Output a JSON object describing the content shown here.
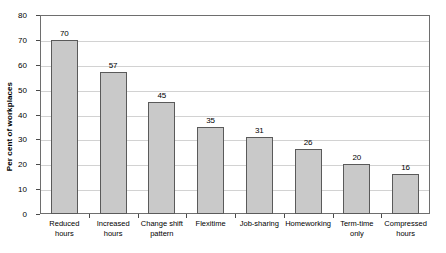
{
  "chart_data": {
    "type": "bar",
    "title": "",
    "xlabel": "",
    "ylabel": "Per cent of workplaces",
    "ylim": [
      0,
      80
    ],
    "ytick_step": 10,
    "yticks": [
      "0",
      "10",
      "20",
      "30",
      "40",
      "50",
      "60",
      "70",
      "80"
    ],
    "grid": true,
    "legend": "none",
    "categories": [
      "Reduced\nhours",
      "Increased\nhours",
      "Change shift\npattern",
      "Flexitime",
      "Job-sharing",
      "Homeworking",
      "Term-time\nonly",
      "Compressed\nhours"
    ],
    "category_lines": [
      [
        "Reduced",
        "hours"
      ],
      [
        "Increased",
        "hours"
      ],
      [
        "Change shift",
        "pattern"
      ],
      [
        "Flexitime",
        ""
      ],
      [
        "Job-sharing",
        ""
      ],
      [
        "Homeworking",
        ""
      ],
      [
        "Term-time",
        "only"
      ],
      [
        "Compressed",
        "hours"
      ]
    ],
    "values": [
      70,
      57,
      45,
      35,
      31,
      26,
      20,
      16
    ],
    "data_labels": [
      "70",
      "57",
      "45",
      "35",
      "31",
      "26",
      "20",
      "16"
    ],
    "colors": {
      "bar_fill": "#c9c9c9",
      "bar_stroke": "#5a5a5a",
      "gridline": "#d2d2d2",
      "axis": "#6e6e6e",
      "text": "#000000",
      "background": "#ffffff"
    }
  }
}
